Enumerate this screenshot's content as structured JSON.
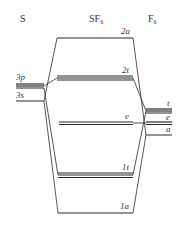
{
  "diagram": {
    "columns": {
      "left": "S",
      "center_base": "SF",
      "center_sub": "6",
      "right_base": "F",
      "right_sub": "6"
    },
    "sulfur_orbitals": [
      {
        "label": "3p"
      },
      {
        "label": "3s"
      }
    ],
    "molecular_orbitals": [
      {
        "label": "2a"
      },
      {
        "label": "2t"
      },
      {
        "label": "e"
      },
      {
        "label": "1t"
      },
      {
        "label": "1a"
      }
    ],
    "fluorine_orbitals": [
      {
        "label": "t"
      },
      {
        "label": "e"
      },
      {
        "label": "a"
      }
    ],
    "colors": {
      "line": "#2a2a2a",
      "background": "#ffffff"
    }
  }
}
